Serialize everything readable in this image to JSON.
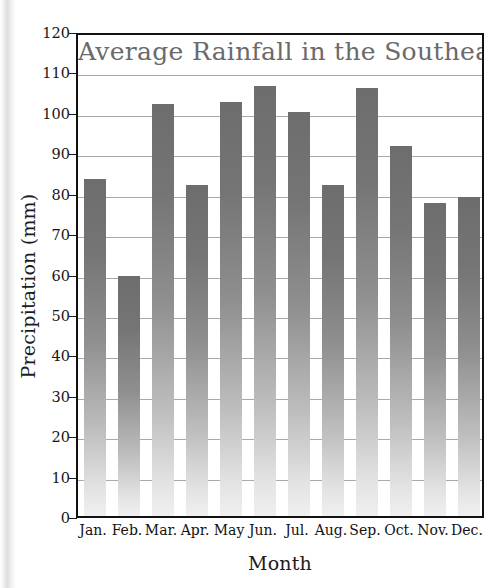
{
  "chart_data": {
    "type": "bar",
    "title": "Average Rainfall in the Southeast",
    "xlabel": "Month",
    "ylabel": "Precipitation (mm)",
    "categories": [
      "Jan.",
      "Feb.",
      "Mar.",
      "Apr.",
      "May",
      "Jun.",
      "Jul.",
      "Aug.",
      "Sep.",
      "Oct.",
      "Nov.",
      "Dec."
    ],
    "values": [
      83.5,
      59.5,
      102,
      82,
      102.5,
      106.5,
      100,
      82,
      106,
      91.5,
      77.5,
      79
    ],
    "ylim": [
      0,
      120
    ],
    "ytick_step": 10,
    "yticks": [
      0,
      10,
      20,
      30,
      40,
      50,
      60,
      70,
      80,
      90,
      100,
      110,
      120
    ],
    "ytick_labels": [
      "0",
      "10",
      "20",
      "30",
      "40",
      "50",
      "60",
      "70",
      "80",
      "90",
      "100",
      "110",
      "120"
    ],
    "grid": true,
    "grid_axis": "y",
    "legend": false,
    "series_name": "Average Rainfall",
    "bar_color_top": "#6d6d6d",
    "bar_color_bottom": "#f0f0f0",
    "title_color": "#6a6a6a",
    "axis_color": "#121212",
    "gridline_color": "#9a9a9a"
  }
}
